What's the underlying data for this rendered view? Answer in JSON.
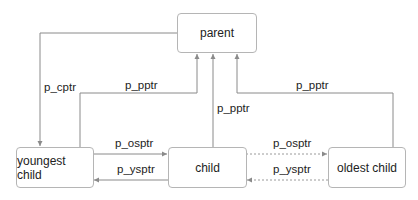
{
  "diagram": {
    "nodes": {
      "parent": "parent",
      "youngest": "youngest child",
      "child": "child",
      "oldest": "oldest child"
    },
    "edges": {
      "cptr": "p_cptr",
      "pptr_youngest": "p_pptr",
      "pptr_child": "p_pptr",
      "pptr_oldest": "p_pptr",
      "osptr_1": "p_osptr",
      "ysptr_1": "p_ysptr",
      "osptr_2": "p_osptr",
      "ysptr_2": "p_ysptr"
    },
    "colors": {
      "line": "#8a8a8a",
      "border": "#b5b5b5",
      "text": "#222222"
    }
  }
}
